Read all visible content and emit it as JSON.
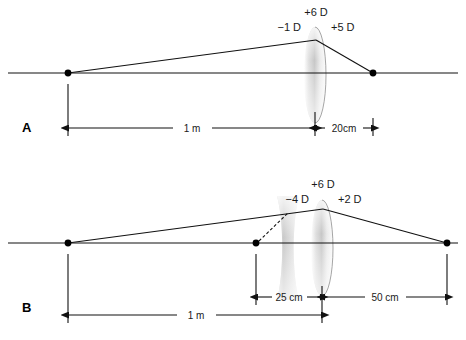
{
  "figure": {
    "background_color": "#ffffff",
    "ink_color": "#111111"
  },
  "panels": [
    {
      "letter": "A",
      "letter_pos": {
        "x": 22,
        "y": 130
      },
      "axis": {
        "y": 73,
        "x1": 8,
        "x2": 458
      },
      "points": [
        {
          "name": "object-point",
          "x": 68,
          "y": 73
        },
        {
          "name": "image-point",
          "x": 373,
          "y": 73
        }
      ],
      "rays": [
        {
          "name": "incident-ray",
          "d": "M 68 73 L 316 40"
        },
        {
          "name": "refracted-ray",
          "d": "M 316 40 L 373 73"
        }
      ],
      "lenses": [
        {
          "name": "convex-lens",
          "type": "convex",
          "cx": 315,
          "cy": 75,
          "rx": 11,
          "ry": 48
        }
      ],
      "power_labels": [
        {
          "name": "total-power-label",
          "text": "+6 D",
          "x": 316,
          "y": 16,
          "anchor": "middle"
        },
        {
          "name": "front-surface-power-label",
          "text": "−1 D",
          "x": 300,
          "y": 31,
          "anchor": "end"
        },
        {
          "name": "back-surface-power-label",
          "text": "+5 D",
          "x": 332,
          "y": 31,
          "anchor": "start"
        }
      ],
      "dimensions": [
        {
          "name": "dimension-1m",
          "label": "1 m",
          "x1": 68,
          "x2": 315,
          "y": 128,
          "label_x": 192,
          "label_y": 125
        },
        {
          "name": "dimension-20cm",
          "label": "20cm",
          "x1": 315,
          "x2": 373,
          "y": 128,
          "label_x": 344,
          "label_y": 125
        }
      ],
      "extension_ticks": [
        {
          "name": "tick-object",
          "x": 68,
          "y1": 83,
          "y2": 135
        },
        {
          "name": "tick-lens",
          "x": 315,
          "y1": 112,
          "y2": 135
        },
        {
          "name": "tick-image",
          "x": 373,
          "y1": 118,
          "y2": 135
        }
      ]
    },
    {
      "letter": "B",
      "letter_pos": {
        "x": 22,
        "y": 310
      },
      "axis": {
        "y": 243,
        "x1": 8,
        "x2": 458
      },
      "points": [
        {
          "name": "object-point",
          "x": 68,
          "y": 243
        },
        {
          "name": "virtual-image-point",
          "x": 256,
          "y": 243
        },
        {
          "name": "image-point",
          "x": 447,
          "y": 243
        }
      ],
      "rays": [
        {
          "name": "incident-ray",
          "d": "M 68 243 L 286 214"
        },
        {
          "name": "intermediate-ray",
          "d": "M 286 214 L 323 209"
        },
        {
          "name": "refracted-ray",
          "d": "M 323 209 L 447 243"
        },
        {
          "name": "virtual-ray-dashed",
          "d": "M 256 243 L 290 212",
          "dashed": true
        }
      ],
      "lenses": [
        {
          "name": "concave-lens",
          "type": "concave",
          "cx": 288,
          "cy": 248,
          "half_w": 11,
          "ry": 52
        },
        {
          "name": "convex-lens",
          "type": "convex",
          "cx": 322,
          "cy": 248,
          "rx": 11,
          "ry": 48
        }
      ],
      "power_labels": [
        {
          "name": "total-power-label",
          "text": "+6 D",
          "x": 323,
          "y": 188,
          "anchor": "middle"
        },
        {
          "name": "diverging-lens-power-label",
          "text": "−4 D",
          "x": 308,
          "y": 203,
          "anchor": "end"
        },
        {
          "name": "converging-lens-power-label",
          "text": "+2 D",
          "x": 338,
          "y": 203,
          "anchor": "start"
        }
      ],
      "dimensions": [
        {
          "name": "dimension-1m",
          "label": "1 m",
          "x1": 68,
          "x2": 322,
          "y": 315,
          "label_x": 196,
          "label_y": 312
        },
        {
          "name": "dimension-25cm",
          "label": "25 cm",
          "x1": 256,
          "x2": 322,
          "y": 297,
          "label_x": 289,
          "label_y": 294
        },
        {
          "name": "dimension-50cm",
          "label": "50 cm",
          "x1": 322,
          "x2": 447,
          "y": 297,
          "label_x": 385,
          "label_y": 294
        }
      ],
      "extension_ticks": [
        {
          "name": "tick-object",
          "x": 68,
          "y1": 253,
          "y2": 322
        },
        {
          "name": "tick-virtual-image",
          "x": 256,
          "y1": 253,
          "y2": 304
        },
        {
          "name": "tick-lens",
          "x": 322,
          "y1": 286,
          "y2": 322
        },
        {
          "name": "tick-image",
          "x": 447,
          "y1": 253,
          "y2": 304
        }
      ]
    }
  ]
}
